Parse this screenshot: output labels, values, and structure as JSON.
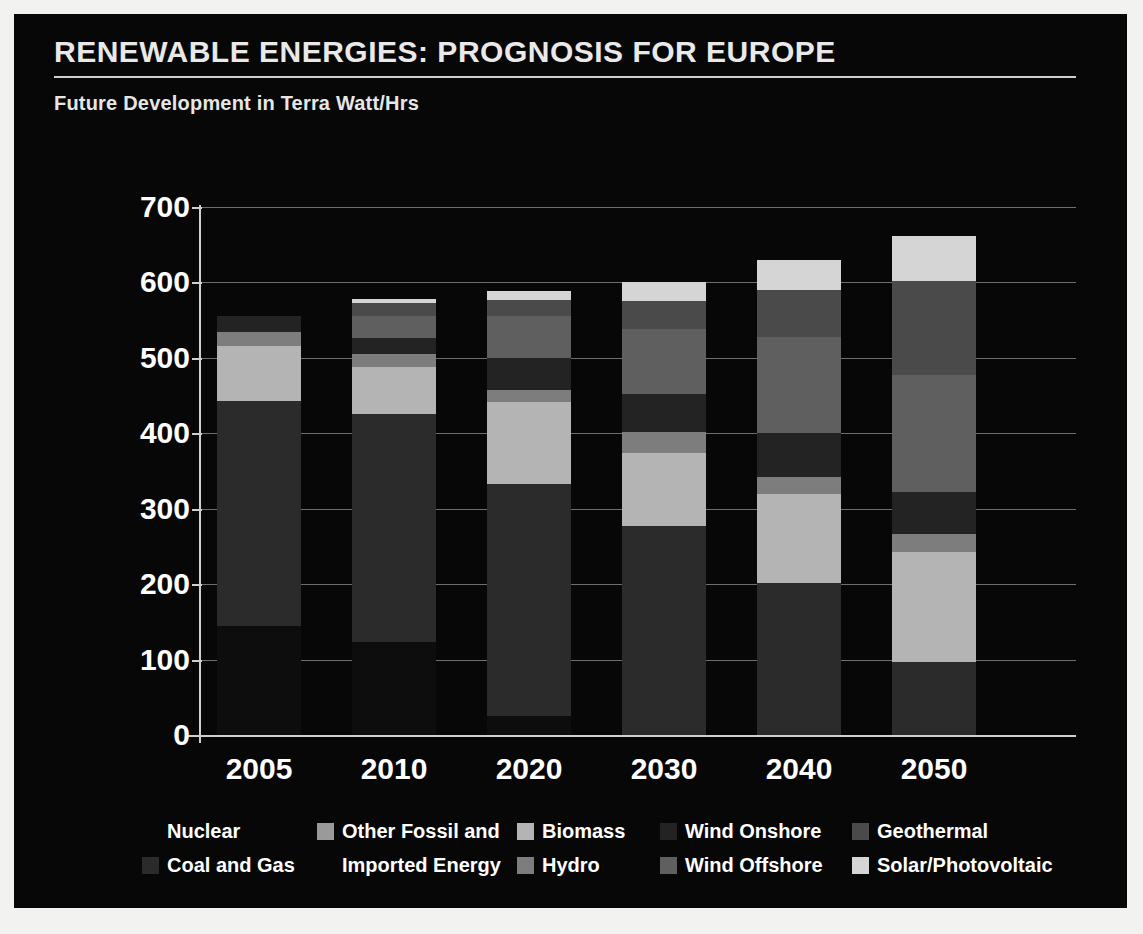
{
  "header": {
    "title": "RENEWABLE ENERGIES: PROGNOSIS FOR EUROPE",
    "subtitle": "Future Development in Terra Watt/Hrs"
  },
  "colors": {
    "background": "#070707",
    "frame": "#f2f2f0",
    "text": "#ffffff",
    "gridline": "#6e6e6e",
    "axis": "#cfcfcf",
    "nuclear": "#0d0d0d",
    "coal_and_gas": "#2b2b2b",
    "other_fossil_and_imported_energy": "#9a9a9a",
    "hydro": "#7d7d7d",
    "biomass": "#b4b4b4",
    "wind_onshore": "#232323",
    "wind_offshore": "#5f5f5f",
    "geothermal": "#4a4a4a",
    "solar_photovoltaic": "#d5d5d5"
  },
  "chart_data": {
    "type": "bar",
    "subtype": "stacked",
    "title": "RENEWABLE ENERGIES: PROGNOSIS FOR EUROPE",
    "subtitle": "Future Development in Terra Watt/Hrs",
    "xlabel": "",
    "ylabel": "",
    "ylim": [
      0,
      700
    ],
    "ytick_labels": [
      "0",
      "100",
      "200",
      "300",
      "400",
      "500",
      "600",
      "700"
    ],
    "yticks": [
      0,
      100,
      200,
      300,
      400,
      500,
      600,
      700
    ],
    "grid": true,
    "legend_position": "bottom",
    "categories": [
      "2005",
      "2010",
      "2020",
      "2030",
      "2040",
      "2050"
    ],
    "series": [
      {
        "name": "Nuclear",
        "color": "#0d0d0d",
        "values": [
          145,
          123,
          25,
          0,
          0,
          0
        ]
      },
      {
        "name": "Coal and Gas",
        "color": "#2b2b2b",
        "values": [
          298,
          303,
          308,
          277,
          202,
          97
        ]
      },
      {
        "name": "Other Fossil and Imported Energy",
        "color": "#9a9a9a",
        "values": [
          0,
          0,
          0,
          0,
          0,
          0
        ]
      },
      {
        "name": "Biomass",
        "color": "#b4b4b4",
        "values": [
          73,
          62,
          108,
          97,
          117,
          145
        ]
      },
      {
        "name": "Hydro",
        "color": "#7d7d7d",
        "values": [
          18,
          17,
          17,
          28,
          23,
          25
        ]
      },
      {
        "name": "Wind Onshore",
        "color": "#232323",
        "values": [
          22,
          22,
          42,
          50,
          58,
          55
        ]
      },
      {
        "name": "Wind Offshore",
        "color": "#5f5f5f",
        "values": [
          0,
          28,
          55,
          86,
          128,
          155
        ]
      },
      {
        "name": "Geothermal",
        "color": "#4a4a4a",
        "values": [
          0,
          18,
          22,
          37,
          62,
          125
        ]
      },
      {
        "name": "Solar/Photovoltaic",
        "color": "#d5d5d5",
        "values": [
          0,
          5,
          11,
          25,
          40,
          60
        ]
      }
    ],
    "totals": [
      556,
      578,
      588,
      600,
      630,
      662
    ]
  },
  "legend": {
    "rows": [
      [
        {
          "label": "Nuclear",
          "color": "#0d0d0d",
          "show_swatch": false
        },
        {
          "label": "Other Fossil and",
          "color": "#9a9a9a",
          "show_swatch": true
        },
        {
          "label": "Biomass",
          "color": "#b4b4b4",
          "show_swatch": true
        },
        {
          "label": "Wind Onshore",
          "color": "#232323",
          "show_swatch": true
        },
        {
          "label": "Geothermal",
          "color": "#4a4a4a",
          "show_swatch": true
        }
      ],
      [
        {
          "label": "Coal and Gas",
          "color": "#2b2b2b",
          "show_swatch": true
        },
        {
          "label": "Imported Energy",
          "color": "#9a9a9a",
          "show_swatch": false
        },
        {
          "label": "Hydro",
          "color": "#7d7d7d",
          "show_swatch": true
        },
        {
          "label": "Wind Offshore",
          "color": "#5f5f5f",
          "show_swatch": true
        },
        {
          "label": "Solar/Photovoltaic",
          "color": "#d5d5d5",
          "show_swatch": true
        }
      ]
    ]
  }
}
